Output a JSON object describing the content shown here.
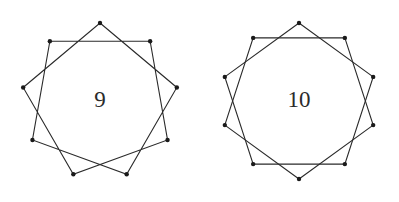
{
  "canvas": {
    "width": 399,
    "height": 202,
    "background_color": "#ffffff"
  },
  "style": {
    "stroke_color": "#2a2a2a",
    "stroke_width": 1.1,
    "vertex_color": "#1a1a1a",
    "vertex_radius": 2.2,
    "label_color": "#2b2b2b"
  },
  "figures": [
    {
      "name": "nonagram",
      "label": "9",
      "n": 9,
      "step": 2,
      "center_x": 100,
      "center_y": 101,
      "radius": 78,
      "start_angle_deg": -90,
      "description": "9-pointed star polygon {9/2} with filled vertex dots"
    },
    {
      "name": "decagram",
      "label": "10",
      "n": 10,
      "step": 2,
      "center_x": 100,
      "center_y": 101,
      "radius": 78,
      "start_angle_deg": -90,
      "description": "10-pointed star polygon {10/2} with filled vertex dots"
    }
  ],
  "chart_data": {
    "type": "diagram",
    "title": "",
    "items": [
      {
        "label": "9",
        "vertices": 9,
        "skip": 2
      },
      {
        "label": "10",
        "vertices": 10,
        "skip": 2
      }
    ]
  }
}
